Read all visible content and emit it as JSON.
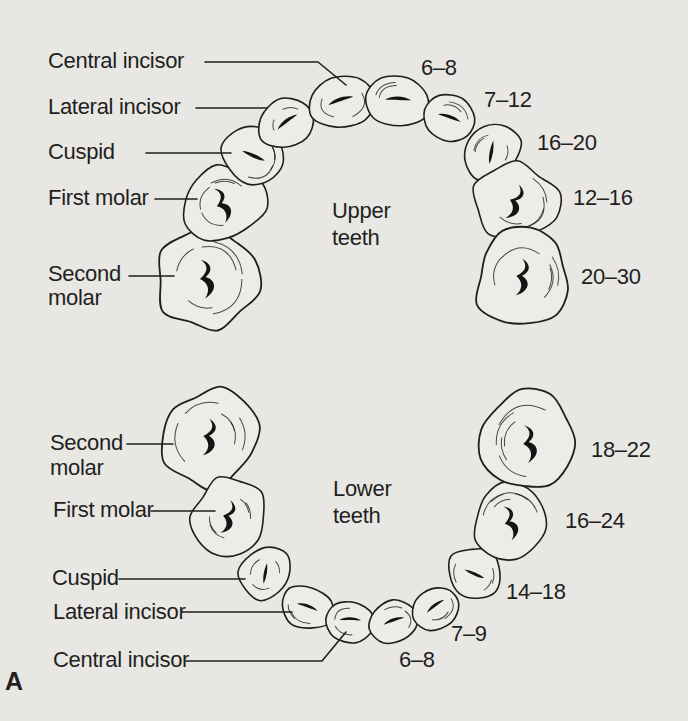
{
  "figure_label": "A",
  "colors": {
    "background": "#e8e7e3",
    "line": "#1f1f1f",
    "tooth_fill": "#edece8",
    "groove": "#141414"
  },
  "upper": {
    "title": [
      "Upper",
      "teeth"
    ],
    "tooth_labels": [
      {
        "name": "Central incisor"
      },
      {
        "name": "Lateral incisor"
      },
      {
        "name": "Cuspid"
      },
      {
        "name": "First molar"
      },
      {
        "name": "Second",
        "name2": "molar"
      }
    ],
    "ages": [
      "6–8",
      "7–12",
      "16–20",
      "12–16",
      "20–30"
    ]
  },
  "lower": {
    "title": [
      "Lower",
      "teeth"
    ],
    "tooth_labels": [
      {
        "name": "Second",
        "name2": "molar"
      },
      {
        "name": "First molar"
      },
      {
        "name": "Cuspid"
      },
      {
        "name": "Lateral incisor"
      },
      {
        "name": "Central incisor"
      }
    ],
    "ages": [
      "18–22",
      "16–24",
      "14–18",
      "7–9",
      "6–8"
    ]
  }
}
